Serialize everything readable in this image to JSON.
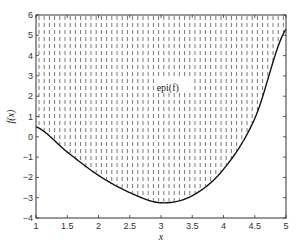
{
  "chart_data": {
    "type": "line",
    "title": "",
    "xlabel": "x",
    "ylabel": "f(x)",
    "xlim": [
      1,
      5
    ],
    "ylim": [
      -4,
      6
    ],
    "xticks": [
      "1",
      "1.5",
      "2",
      "2.5",
      "3",
      "3.5",
      "4",
      "4.5",
      "5"
    ],
    "yticks": [
      "-4",
      "-3",
      "-2",
      "-1",
      "0",
      "1",
      "2",
      "3",
      "4",
      "5",
      "6"
    ],
    "grid": false,
    "annotation": "epi(f)",
    "series": [
      {
        "name": "f(x)",
        "x": [
          1,
          1.5,
          2,
          2.5,
          3,
          3.5,
          4,
          4.5,
          5
        ],
        "y": [
          0.5,
          -0.75,
          -1.9,
          -2.75,
          -3.25,
          -2.9,
          -1.6,
          0.9,
          5.3
        ]
      }
    ],
    "fill": "epigraph (region above curve) shaded with vertical dashed lines"
  },
  "colors": {
    "curve": "#111111",
    "hatch": "#555555",
    "axes": "#333333"
  }
}
